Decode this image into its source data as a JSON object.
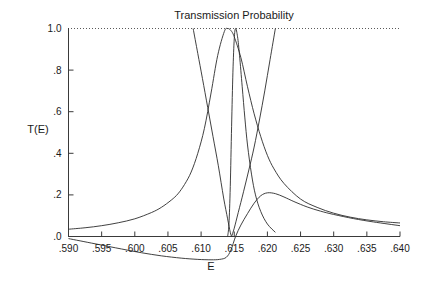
{
  "chart_data": {
    "type": "line",
    "title": "Transmission Probability",
    "xlabel": "E",
    "ylabel": "T(E)",
    "xlim": [
      0.59,
      0.64
    ],
    "ylim": [
      0.0,
      1.0
    ],
    "grid": false,
    "legend": "none",
    "x_ticks": [
      ".590",
      ".595",
      ".600",
      ".605",
      ".610",
      ".615",
      ".620",
      ".625",
      ".630",
      ".635",
      ".640"
    ],
    "x_tick_values": [
      0.59,
      0.595,
      0.6,
      0.605,
      0.61,
      0.615,
      0.62,
      0.625,
      0.63,
      0.635,
      0.64
    ],
    "y_ticks": [
      "1.0",
      ".8",
      ".6",
      ".4",
      ".2",
      ".0"
    ],
    "y_tick_values": [
      1.0,
      0.8,
      0.6,
      0.4,
      0.2,
      0.0
    ],
    "reference_line": {
      "y": 1.0,
      "style": "dotted",
      "label": ""
    },
    "series": [
      {
        "name": "broad-resonance",
        "x": [
          0.59,
          0.5925,
          0.595,
          0.5975,
          0.6,
          0.6025,
          0.604,
          0.6055,
          0.6065,
          0.6075,
          0.6085,
          0.6095,
          0.6105,
          0.6115,
          0.6125,
          0.6135,
          0.614,
          0.6145,
          0.615,
          0.616,
          0.617,
          0.618,
          0.619,
          0.62,
          0.621,
          0.6225,
          0.625,
          0.6275,
          0.63,
          0.6325,
          0.635,
          0.6375,
          0.64
        ],
        "values": [
          0.035,
          0.042,
          0.052,
          0.066,
          0.085,
          0.115,
          0.14,
          0.175,
          0.205,
          0.25,
          0.31,
          0.4,
          0.52,
          0.69,
          0.87,
          0.985,
          1.0,
          0.99,
          0.96,
          0.86,
          0.72,
          0.59,
          0.48,
          0.39,
          0.325,
          0.255,
          0.18,
          0.14,
          0.112,
          0.093,
          0.08,
          0.071,
          0.065
        ]
      },
      {
        "name": "narrow-resonance",
        "x": [
          0.614,
          0.6142,
          0.6144,
          0.6146,
          0.6148,
          0.615,
          0.6152,
          0.6155,
          0.6158,
          0.6162,
          0.6166,
          0.617,
          0.6176,
          0.6182,
          0.619,
          0.62,
          0.6212
        ],
        "values": [
          0.0,
          0.06,
          0.24,
          0.53,
          0.79,
          0.95,
          1.0,
          0.96,
          0.87,
          0.72,
          0.57,
          0.44,
          0.3,
          0.2,
          0.12,
          0.06,
          0.02
        ]
      },
      {
        "name": "steep-left-branch",
        "x": [
          0.6088,
          0.6095,
          0.6102,
          0.611,
          0.6118,
          0.6126,
          0.6134,
          0.614,
          0.6144,
          0.6146
        ],
        "values": [
          1.0,
          0.88,
          0.76,
          0.62,
          0.48,
          0.34,
          0.185,
          0.085,
          0.02,
          0.0
        ]
      },
      {
        "name": "steep-right-branch",
        "x": [
          0.6146,
          0.615,
          0.6156,
          0.6164,
          0.6172,
          0.618,
          0.6188,
          0.6196,
          0.6204,
          0.6212
        ],
        "values": [
          0.0,
          0.04,
          0.115,
          0.215,
          0.32,
          0.43,
          0.56,
          0.7,
          0.85,
          1.0
        ]
      },
      {
        "name": "secondary-broad-peak",
        "x": [
          0.59,
          0.594,
          0.598,
          0.601,
          0.604,
          0.607,
          0.6095,
          0.6115,
          0.6128,
          0.6138,
          0.6145,
          0.6152,
          0.616,
          0.617,
          0.618,
          0.619,
          0.62,
          0.6212,
          0.6225,
          0.624,
          0.626,
          0.628,
          0.63,
          0.633,
          0.636,
          0.64
        ],
        "values": [
          -0.01,
          -0.035,
          -0.06,
          -0.078,
          -0.093,
          -0.104,
          -0.11,
          -0.112,
          -0.11,
          -0.1,
          -0.065,
          0.0,
          0.055,
          0.11,
          0.16,
          0.196,
          0.21,
          0.206,
          0.19,
          0.168,
          0.142,
          0.122,
          0.106,
          0.086,
          0.07,
          0.052
        ]
      }
    ]
  },
  "plot": {
    "title_text": "Transmission Probability",
    "x_axis_label": "E",
    "y_axis_label": "T(E)"
  },
  "colors": {
    "curve": "#2b2b2b",
    "axis": "#3a3a3a",
    "text": "#1a1a1a",
    "background": "#ffffff",
    "reference": "#5a5a5a"
  }
}
